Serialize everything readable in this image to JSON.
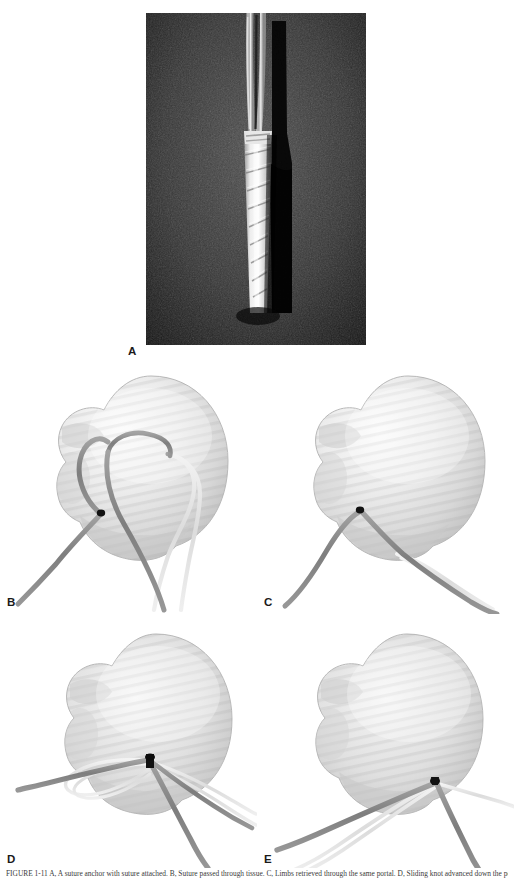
{
  "figure": {
    "panels": [
      {
        "id": "A",
        "label": "A",
        "kind": "photograph",
        "description": "Grayscale intraoperative photograph of a ribbed threaded suture anchor seated in a bone tunnel with two suture limbs exiting proximally"
      },
      {
        "id": "B",
        "label": "B",
        "kind": "illustration",
        "description": "Humeral head illustration with two dark suture limbs and one light suture limb passed in mattress configuration"
      },
      {
        "id": "C",
        "label": "C",
        "kind": "illustration",
        "description": "Humeral head illustration with the dark suture limb exiting the anchor and light limbs drawn together inferiorly"
      },
      {
        "id": "D",
        "label": "D",
        "kind": "illustration",
        "description": "Humeral head illustration showing the sliding knot loop being advanced toward the anchor point"
      },
      {
        "id": "E",
        "label": "E",
        "kind": "illustration",
        "description": "Humeral head illustration with all suture limbs tensioned and converging at the seated anchor"
      }
    ],
    "caption": "FIGURE 1-11  A, A suture anchor with suture attached. B, Suture passed through tissue. C, Limbs retrieved through the same portal. D, Sliding knot advanced down the post. E, Knot seated on the tissue with limbs tensioned.",
    "colors": {
      "suture_dark": "#8a8a8a",
      "suture_light": "#e2e2e2",
      "anchor_point": "#111111",
      "bone_light": "#f2f2f2",
      "bone_mid": "#d6d6d6",
      "bone_shadow": "#b4b4b4",
      "photo_background": "#0b0b0b",
      "label_text": "#1a1a1a"
    }
  }
}
